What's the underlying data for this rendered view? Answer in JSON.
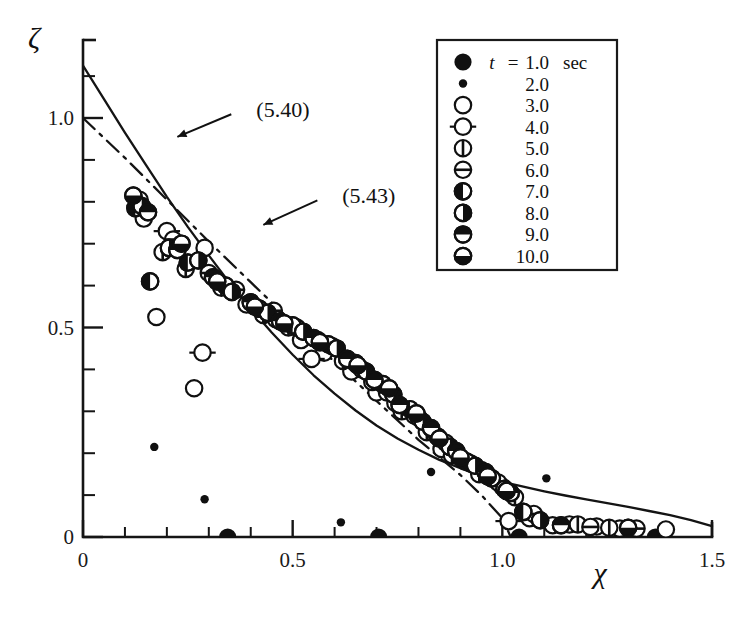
{
  "chart_data": {
    "type": "scatter",
    "title": "",
    "subtitle": "",
    "xlabel": "χ",
    "ylabel": "ζ",
    "xlim": [
      0,
      1.5
    ],
    "ylim": [
      0,
      1.2
    ],
    "grid": false,
    "x_ticks_major": [
      0,
      0.5,
      1.0,
      1.5
    ],
    "x_ticklabels": [
      "0",
      "0.5",
      "1.0",
      "1.5"
    ],
    "x_ticks_minor": [
      0.1,
      0.2,
      0.3,
      0.4,
      0.6,
      0.7,
      0.8,
      0.9,
      1.1,
      1.2,
      1.3,
      1.4
    ],
    "y_ticks_major": [
      0,
      0.5,
      1.0
    ],
    "y_ticklabels": [
      "0",
      "0.5",
      "1.0"
    ],
    "y_ticks_minor": [
      0.1,
      0.2,
      0.3,
      0.4,
      0.6,
      0.7,
      0.8,
      0.9,
      1.1
    ],
    "annotations": [
      {
        "text": "(5.40)",
        "x": 0.38,
        "y": 1.02,
        "arrow_to_x": 0.225,
        "arrow_to_y": 0.955,
        "points_to": "solid-curve"
      },
      {
        "text": "(5.43)",
        "x": 0.585,
        "y": 0.815,
        "arrow_to_x": 0.43,
        "arrow_to_y": 0.745,
        "points_to": "dashdot-curve"
      }
    ],
    "legend": {
      "position": "top-right",
      "variable": "t",
      "equals": "=",
      "unit": "sec",
      "entries": [
        {
          "label": "1.0",
          "marker": "filled-circle-large"
        },
        {
          "label": "2.0",
          "marker": "filled-dot-small"
        },
        {
          "label": "3.0",
          "marker": "open-circle"
        },
        {
          "label": "4.0",
          "marker": "open-circle-with-horizontal-bars"
        },
        {
          "label": "5.0",
          "marker": "circle-vertical-bar"
        },
        {
          "label": "6.0",
          "marker": "circle-horizontal-bar"
        },
        {
          "label": "7.0",
          "marker": "circle-left-half-filled"
        },
        {
          "label": "8.0",
          "marker": "circle-right-half-filled"
        },
        {
          "label": "9.0",
          "marker": "circle-top-filled"
        },
        {
          "label": "10.0",
          "marker": "circle-bottom-filled"
        }
      ]
    },
    "series": [
      {
        "name": "(5.40)",
        "style": "solid-line",
        "type": "line",
        "points": [
          [
            0.0,
            1.125
          ],
          [
            0.05,
            1.045
          ],
          [
            0.1,
            0.965
          ],
          [
            0.15,
            0.888
          ],
          [
            0.2,
            0.812
          ],
          [
            0.25,
            0.74
          ],
          [
            0.3,
            0.672
          ],
          [
            0.35,
            0.606
          ],
          [
            0.4,
            0.545
          ],
          [
            0.45,
            0.488
          ],
          [
            0.5,
            0.435
          ],
          [
            0.55,
            0.386
          ],
          [
            0.6,
            0.342
          ],
          [
            0.65,
            0.302
          ],
          [
            0.7,
            0.266
          ],
          [
            0.75,
            0.235
          ],
          [
            0.8,
            0.208
          ],
          [
            0.85,
            0.184
          ],
          [
            0.9,
            0.164
          ],
          [
            0.95,
            0.147
          ],
          [
            1.0,
            0.132
          ],
          [
            1.05,
            0.12
          ],
          [
            1.1,
            0.109
          ],
          [
            1.15,
            0.099
          ],
          [
            1.2,
            0.09
          ],
          [
            1.25,
            0.081
          ],
          [
            1.3,
            0.072
          ],
          [
            1.35,
            0.062
          ],
          [
            1.4,
            0.052
          ],
          [
            1.45,
            0.04
          ],
          [
            1.5,
            0.026
          ]
        ]
      },
      {
        "name": "(5.43)",
        "style": "dash-dot-line",
        "type": "line",
        "points": [
          [
            0.0,
            1.0
          ],
          [
            0.1,
            0.905
          ],
          [
            0.2,
            0.805
          ],
          [
            0.3,
            0.705
          ],
          [
            0.4,
            0.608
          ],
          [
            0.5,
            0.512
          ],
          [
            0.6,
            0.418
          ],
          [
            0.7,
            0.325
          ],
          [
            0.8,
            0.232
          ],
          [
            0.9,
            0.148
          ],
          [
            0.95,
            0.1
          ],
          [
            1.0,
            0.045
          ],
          [
            1.02,
            0.0
          ]
        ]
      },
      {
        "name": "t = 1.0 sec",
        "marker": "filled-circle-large",
        "type": "scatter",
        "points": [
          [
            0.345,
            0.0
          ],
          [
            0.705,
            0.0
          ],
          [
            1.04,
            0.0
          ],
          [
            1.365,
            0.0
          ]
        ]
      },
      {
        "name": "t = 2.0 sec",
        "marker": "filled-dot-small",
        "type": "scatter",
        "points": [
          [
            0.17,
            0.215
          ],
          [
            0.29,
            0.09
          ],
          [
            0.615,
            0.035
          ],
          [
            0.83,
            0.155
          ],
          [
            1.105,
            0.14
          ]
        ]
      },
      {
        "name": "t = 3.0 sec",
        "marker": "open-circle",
        "type": "scatter",
        "points": [
          [
            0.145,
            0.76
          ],
          [
            0.175,
            0.525
          ],
          [
            0.23,
            0.7
          ],
          [
            0.265,
            0.355
          ],
          [
            0.29,
            0.69
          ],
          [
            0.39,
            0.555
          ],
          [
            0.46,
            0.52
          ],
          [
            0.52,
            0.47
          ],
          [
            0.575,
            0.44
          ],
          [
            0.64,
            0.395
          ],
          [
            0.7,
            0.345
          ],
          [
            0.745,
            0.32
          ],
          [
            0.79,
            0.29
          ],
          [
            0.855,
            0.21
          ],
          [
            0.905,
            0.185
          ],
          [
            0.95,
            0.16
          ],
          [
            1.0,
            0.12
          ],
          [
            1.065,
            0.045
          ],
          [
            1.16,
            0.03
          ],
          [
            1.225,
            0.025
          ],
          [
            1.28,
            0.02
          ],
          [
            1.39,
            0.018
          ]
        ]
      },
      {
        "name": "t = 4.0 sec",
        "marker": "open-circle-with-horizontal-bars",
        "type": "scatter",
        "points": [
          [
            0.2,
            0.73
          ],
          [
            0.285,
            0.44
          ],
          [
            0.545,
            0.425
          ],
          [
            1.015,
            0.038
          ],
          [
            1.12,
            0.028
          ]
        ]
      },
      {
        "name": "t = 5.0 sec",
        "marker": "circle-vertical-bar",
        "type": "scatter",
        "points": [
          [
            0.135,
            0.805
          ],
          [
            0.19,
            0.68
          ],
          [
            0.245,
            0.64
          ],
          [
            0.33,
            0.595
          ],
          [
            0.43,
            0.53
          ],
          [
            0.49,
            0.5
          ],
          [
            0.56,
            0.47
          ],
          [
            0.62,
            0.42
          ],
          [
            0.69,
            0.37
          ],
          [
            0.76,
            0.3
          ],
          [
            0.82,
            0.25
          ],
          [
            0.88,
            0.195
          ],
          [
            0.945,
            0.15
          ],
          [
            1.03,
            0.095
          ],
          [
            1.18,
            0.03
          ],
          [
            1.255,
            0.022
          ]
        ]
      },
      {
        "name": "t = 6.0 sec",
        "marker": "circle-horizontal-bar",
        "type": "scatter",
        "points": [
          [
            0.13,
            0.795
          ],
          [
            0.215,
            0.71
          ],
          [
            0.3,
            0.63
          ],
          [
            0.365,
            0.59
          ],
          [
            0.455,
            0.54
          ],
          [
            0.51,
            0.5
          ],
          [
            0.595,
            0.455
          ],
          [
            0.665,
            0.4
          ],
          [
            0.725,
            0.345
          ],
          [
            0.8,
            0.285
          ],
          [
            0.865,
            0.225
          ],
          [
            0.925,
            0.175
          ],
          [
            0.99,
            0.13
          ],
          [
            1.075,
            0.055
          ],
          [
            1.21,
            0.024
          ],
          [
            1.32,
            0.02
          ]
        ]
      },
      {
        "name": "t = 7.0 sec",
        "marker": "circle-left-half-filled",
        "type": "scatter",
        "points": [
          [
            0.125,
            0.785
          ],
          [
            0.16,
            0.61
          ],
          [
            0.25,
            0.655
          ],
          [
            0.34,
            0.6
          ],
          [
            0.42,
            0.545
          ],
          [
            0.5,
            0.505
          ],
          [
            0.585,
            0.46
          ],
          [
            0.65,
            0.415
          ],
          [
            0.715,
            0.365
          ],
          [
            0.78,
            0.305
          ],
          [
            0.845,
            0.24
          ],
          [
            0.915,
            0.18
          ],
          [
            0.975,
            0.14
          ],
          [
            1.05,
            0.06
          ]
        ]
      },
      {
        "name": "t = 8.0 sec",
        "marker": "circle-right-half-filled",
        "type": "scatter",
        "points": [
          [
            0.14,
            0.79
          ],
          [
            0.205,
            0.69
          ],
          [
            0.275,
            0.66
          ],
          [
            0.355,
            0.585
          ],
          [
            0.44,
            0.535
          ],
          [
            0.525,
            0.49
          ],
          [
            0.605,
            0.45
          ],
          [
            0.675,
            0.395
          ],
          [
            0.74,
            0.34
          ],
          [
            0.81,
            0.275
          ],
          [
            0.875,
            0.215
          ],
          [
            0.935,
            0.17
          ],
          [
            1.005,
            0.115
          ],
          [
            1.09,
            0.04
          ]
        ]
      },
      {
        "name": "t = 9.0 sec",
        "marker": "circle-top-filled",
        "type": "scatter",
        "points": [
          [
            0.155,
            0.775
          ],
          [
            0.225,
            0.685
          ],
          [
            0.31,
            0.62
          ],
          [
            0.4,
            0.56
          ],
          [
            0.47,
            0.515
          ],
          [
            0.55,
            0.475
          ],
          [
            0.63,
            0.425
          ],
          [
            0.695,
            0.375
          ],
          [
            0.755,
            0.315
          ],
          [
            0.83,
            0.26
          ],
          [
            0.89,
            0.205
          ],
          [
            0.96,
            0.155
          ],
          [
            1.02,
            0.105
          ],
          [
            1.14,
            0.028
          ]
        ]
      },
      {
        "name": "t = 10.0 sec",
        "marker": "circle-bottom-filled",
        "type": "scatter",
        "points": [
          [
            0.12,
            0.815
          ],
          [
            0.235,
            0.7
          ],
          [
            0.32,
            0.61
          ],
          [
            0.41,
            0.55
          ],
          [
            0.48,
            0.51
          ],
          [
            0.565,
            0.465
          ],
          [
            0.655,
            0.41
          ],
          [
            0.73,
            0.355
          ],
          [
            0.795,
            0.295
          ],
          [
            0.85,
            0.235
          ],
          [
            0.9,
            0.19
          ],
          [
            0.965,
            0.145
          ],
          [
            1.01,
            0.11
          ],
          [
            1.3,
            0.022
          ]
        ]
      }
    ]
  }
}
